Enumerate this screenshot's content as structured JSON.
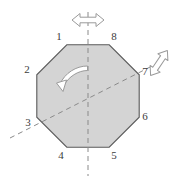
{
  "figure": {
    "name": "regular-octagon-symmetry-diagram",
    "shape": {
      "kind": "regular-octagon",
      "fill_color": "#d4d4d4",
      "stroke_color": "#5a5a5a",
      "center": {
        "x": 88,
        "y": 92
      },
      "circumradius": 58
    },
    "vertex_labels": [
      {
        "id": "1",
        "text": "1",
        "x": 59,
        "y": 40
      },
      {
        "id": "2",
        "text": "2",
        "x": 27,
        "y": 73
      },
      {
        "id": "3",
        "text": "3",
        "x": 28,
        "y": 126
      },
      {
        "id": "4",
        "text": "4",
        "x": 61,
        "y": 159
      },
      {
        "id": "5",
        "text": "5",
        "x": 114,
        "y": 159
      },
      {
        "id": "6",
        "text": "6",
        "x": 145,
        "y": 120
      },
      {
        "id": "7",
        "text": "7",
        "x": 145,
        "y": 75
      },
      {
        "id": "8",
        "text": "8",
        "x": 114,
        "y": 40
      }
    ],
    "axes": [
      {
        "id": "vertical-mirror-axis",
        "label": "vertical reflection axis",
        "style": "dashed",
        "color": "#8a8a8a",
        "x1": 88,
        "y1": 12,
        "x2": 88,
        "y2": 176
      },
      {
        "id": "diagonal-mirror-axis",
        "label": "diagonal reflection axis through vertices 3 and 7",
        "style": "dashed",
        "color": "#8a8a8a",
        "x1": 10,
        "y1": 138,
        "x2": 160,
        "y2": 62
      }
    ],
    "rotation_arrow": {
      "id": "rotation-arrow",
      "label": "counterclockwise rotation arrow",
      "direction": "counterclockwise",
      "outline_color": "#9a9a9a",
      "fill_color": "#ffffff"
    },
    "double_arrows": [
      {
        "id": "horizontal-double-arrow",
        "label": "horizontal double-headed arrow above vertical axis",
        "orientation": "horizontal",
        "outline_color": "#9a9a9a",
        "fill_color": "#ffffff",
        "center": {
          "x": 88,
          "y": 20
        }
      },
      {
        "id": "diagonal-double-arrow",
        "label": "diagonal double-headed arrow beyond vertex 7",
        "orientation": "diagonal",
        "outline_color": "#9a9a9a",
        "fill_color": "#ffffff",
        "center": {
          "x": 159,
          "y": 63
        }
      }
    ]
  }
}
